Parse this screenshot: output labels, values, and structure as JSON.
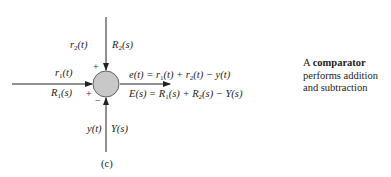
{
  "figure": {
    "caption": "(c)",
    "node": {
      "name": "comparator",
      "fill": "#c8c8c8",
      "stroke": "#333333"
    },
    "inputs": [
      {
        "id": "r1",
        "time": "r1(t)",
        "laplace": "R1(s)",
        "sign": "+"
      },
      {
        "id": "r2",
        "time": "r2(t)",
        "laplace": "R2(s)",
        "sign": "+"
      },
      {
        "id": "y",
        "time": "y(t)",
        "laplace": "Y(s)",
        "sign": "−"
      }
    ],
    "output": {
      "time_eq": "e(t) = r1(t) + r2(t) − y(t)",
      "laplace_eq": "E(s) = R1(s) + R2(s) − Y(s)"
    }
  },
  "side_note": {
    "prefix": "A ",
    "bold": "comparator",
    "line2": "performs addition",
    "line3": "and subtraction"
  }
}
